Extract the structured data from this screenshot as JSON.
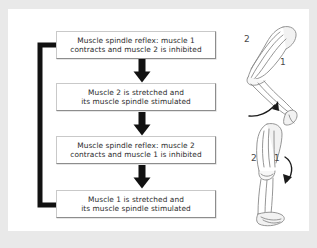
{
  "figure": {
    "background_color": "#e9e9e9",
    "panel_color": "#ffffff",
    "arrow_color": "#111111",
    "box_border_color": "#8d8d8d",
    "text_color": "#2b2b2b",
    "illustration_color": "#6e6e6e"
  },
  "flowchart": {
    "steps": [
      {
        "id": "step-1",
        "line_1": "Muscle spindle reflex: muscle 1",
        "line_2": "contracts and muscle 2 is inhibited"
      },
      {
        "id": "step-2",
        "line_1": "Muscle 2 is stretched and",
        "line_2": "its muscle spindle stimulated"
      },
      {
        "id": "step-3",
        "line_1": "Muscle spindle reflex: muscle 2",
        "line_2": "contracts and muscle 1 is inhibited"
      },
      {
        "id": "step-4",
        "line_1": "Muscle 1 is stretched and",
        "line_2": "its muscle spindle stimulated"
      }
    ],
    "connectors": [
      {
        "id": "connector-1-2",
        "type": "down-arrow"
      },
      {
        "id": "connector-2-3",
        "type": "down-arrow"
      },
      {
        "id": "connector-3-4",
        "type": "down-arrow"
      }
    ],
    "feedback_loop": {
      "id": "feedback-loop",
      "type": "loop-arrow",
      "from_step": "step-4",
      "to_step": "step-1"
    }
  },
  "illustrations": [
    {
      "id": "leg-bent",
      "description": "flexed leg with knee bent",
      "label_back": "2",
      "label_front": "1",
      "motion_arrow": "curved-arrow-up"
    },
    {
      "id": "leg-straight",
      "description": "extended leg straightened",
      "label_back": "2",
      "label_front": "1",
      "motion_arrow": "curved-arrow-down"
    }
  ]
}
